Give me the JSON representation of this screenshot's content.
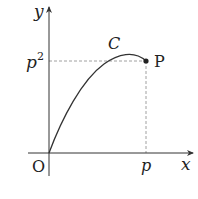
{
  "diagram": {
    "axes": {
      "x_label": "x",
      "y_label": "y",
      "origin_label": "O"
    },
    "curve_label": "C",
    "point": {
      "label": "P",
      "x_label": "p",
      "y_label_base": "p",
      "y_label_exp": "2"
    },
    "colors": {
      "stroke": "#333333",
      "dash": "#888888",
      "background": "#ffffff"
    }
  }
}
